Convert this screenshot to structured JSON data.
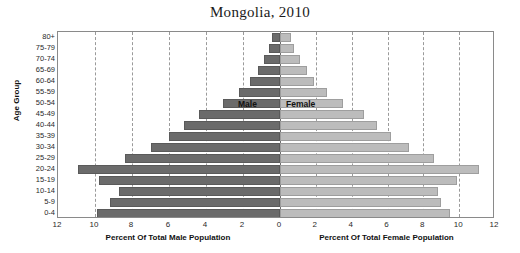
{
  "chart_data": {
    "type": "bar",
    "subtype": "population-pyramid",
    "title": "Mongolia, 2010",
    "ylabel": "Age Group",
    "xlabel_left": "Percent Of Total Male Population",
    "xlabel_right": "Percent Of Total Female Population",
    "categories": [
      "80+",
      "75-79",
      "70-74",
      "65-69",
      "60-64",
      "55-59",
      "50-54",
      "45-49",
      "40-44",
      "35-39",
      "30-34",
      "25-29",
      "20-24",
      "15-19",
      "10-14",
      "5-9",
      "0-4"
    ],
    "xlim": [
      0,
      12
    ],
    "xticks": [
      12,
      10,
      8,
      6,
      4,
      2,
      0,
      2,
      4,
      6,
      8,
      10,
      12
    ],
    "grid": true,
    "gridlines_at": [
      2,
      4,
      6,
      8,
      10
    ],
    "legend_position": "inside-center",
    "series": [
      {
        "name": "Male",
        "side": "left",
        "color": "#6b6b6b",
        "values": [
          0.45,
          0.6,
          0.85,
          1.2,
          1.6,
          2.2,
          3.1,
          4.4,
          5.2,
          6.0,
          7.0,
          8.4,
          10.9,
          9.8,
          8.7,
          9.2,
          9.9
        ]
      },
      {
        "name": "Female",
        "side": "right",
        "color": "#bcbcbc",
        "values": [
          0.6,
          0.8,
          1.1,
          1.5,
          1.9,
          2.6,
          3.5,
          4.7,
          5.4,
          6.2,
          7.2,
          8.6,
          11.1,
          9.9,
          8.8,
          9.0,
          9.5
        ]
      }
    ]
  }
}
